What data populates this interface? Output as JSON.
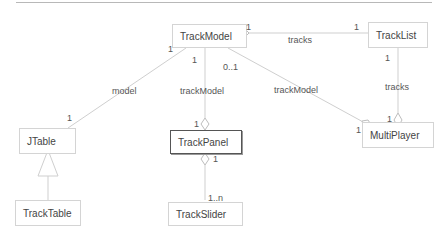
{
  "diagram": {
    "type": "uml-class",
    "classes": [
      {
        "id": "TrackModel",
        "label": "TrackModel"
      },
      {
        "id": "TrackList",
        "label": "TrackList"
      },
      {
        "id": "JTable",
        "label": "JTable"
      },
      {
        "id": "TrackPanel",
        "label": "TrackPanel"
      },
      {
        "id": "MultiPlayer",
        "label": "MultiPlayer"
      },
      {
        "id": "TrackTable",
        "label": "TrackTable"
      },
      {
        "id": "TrackSlider",
        "label": "TrackSlider"
      }
    ],
    "associations": [
      {
        "from": "TrackModel",
        "to": "TrackList",
        "role": "tracks",
        "from_mult": "1",
        "to_mult": "1",
        "aggregation_at": "TrackModel"
      },
      {
        "from": "TrackModel",
        "to": "JTable",
        "role": "model",
        "from_mult": "1",
        "to_mult": "1"
      },
      {
        "from": "TrackModel",
        "to": "TrackPanel",
        "role": "trackModel",
        "from_mult": "1",
        "to_mult": "1",
        "aggregation_at": "TrackPanel"
      },
      {
        "from": "TrackModel",
        "to": "MultiPlayer",
        "role": "trackModel",
        "from_mult": "0..1",
        "to_mult": "1",
        "aggregation_at": "MultiPlayer"
      },
      {
        "from": "TrackList",
        "to": "MultiPlayer",
        "role": "tracks",
        "from_mult": "1",
        "to_mult": "1",
        "aggregation_at": "MultiPlayer"
      },
      {
        "from": "TrackPanel",
        "to": "TrackSlider",
        "role": "",
        "from_mult": "1",
        "to_mult": "1..n",
        "aggregation_at": "TrackPanel"
      }
    ],
    "generalizations": [
      {
        "child": "TrackTable",
        "parent": "JTable"
      }
    ],
    "labels": {
      "tracks_top": "tracks",
      "tracks_right": "tracks",
      "model": "model",
      "trackModel_mid": "trackModel",
      "trackModel_right": "trackModel",
      "m_tm_tl": "1",
      "m_tl_tm": "1",
      "m_tm_left": "1",
      "m_tm_down": "1",
      "m_tm_01": "0..1",
      "m_tl_down": "1",
      "m_jtable": "1",
      "m_panel_top": "1",
      "m_panel_bottom": "1",
      "m_mp_left": "1",
      "m_mp_top": "1",
      "m_slider": "1..n"
    }
  }
}
